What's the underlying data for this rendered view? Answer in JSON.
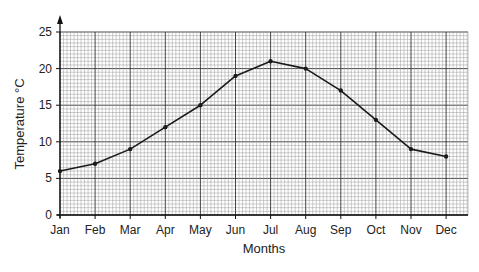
{
  "chart_data": {
    "type": "line",
    "title": "",
    "xlabel": "Months",
    "ylabel": "Temperature °C",
    "categories": [
      "Jan",
      "Feb",
      "Mar",
      "Apr",
      "May",
      "Jun",
      "Jul",
      "Aug",
      "Sep",
      "Oct",
      "Nov",
      "Dec"
    ],
    "series": [
      {
        "name": "Temperature",
        "values": [
          6,
          7,
          9,
          12,
          15,
          19,
          21,
          20,
          17,
          13,
          9,
          8
        ]
      }
    ],
    "ylim": [
      0,
      25
    ],
    "yticks": [
      0,
      5,
      10,
      15,
      20,
      25
    ],
    "grid": true,
    "legend": "none",
    "line_color": "#1a1a1a",
    "grid_color": "#555555"
  }
}
